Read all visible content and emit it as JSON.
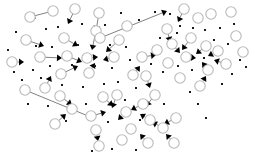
{
  "figure": {
    "kind": "network-graph",
    "title": "",
    "background_color": "#ffffff",
    "width": 255,
    "height": 163
  },
  "chart_data": {
    "type": "scatter",
    "title": "",
    "xlabel": "",
    "ylabel": "",
    "grid": false,
    "legend": false,
    "xlim": [
      0,
      255
    ],
    "ylim": [
      0,
      163
    ],
    "style": {
      "node_fill": "#ffffff",
      "node_stroke": "#b9b9b9",
      "node_radius": 5.2,
      "leaf_color": "#1a1a1a",
      "leaf_size": 2.0,
      "edge_color": "#4a4a4a",
      "edge_width": 0.7,
      "arrow_color": "#000000"
    },
    "counts": {
      "circle_nodes": 58,
      "leaf_dots": 62,
      "edges": 34
    },
    "circle_nodes": [
      [
        30,
        17
      ],
      [
        53,
        11
      ],
      [
        75,
        9
      ],
      [
        99,
        13
      ],
      [
        96,
        31
      ],
      [
        26,
        40
      ],
      [
        64,
        38
      ],
      [
        100,
        38
      ],
      [
        40,
        57
      ],
      [
        67,
        56
      ],
      [
        87,
        58
      ],
      [
        114,
        57
      ],
      [
        61,
        74
      ],
      [
        89,
        73
      ],
      [
        119,
        40
      ],
      [
        127,
        26
      ],
      [
        45,
        88
      ],
      [
        25,
        90
      ],
      [
        60,
        96
      ],
      [
        72,
        109
      ],
      [
        91,
        116
      ],
      [
        96,
        130
      ],
      [
        99,
        146
      ],
      [
        103,
        97
      ],
      [
        117,
        95
      ],
      [
        126,
        112
      ],
      [
        131,
        129
      ],
      [
        122,
        140
      ],
      [
        143,
        104
      ],
      [
        155,
        95
      ],
      [
        150,
        120
      ],
      [
        163,
        128
      ],
      [
        176,
        118
      ],
      [
        184,
        9
      ],
      [
        198,
        18
      ],
      [
        167,
        29
      ],
      [
        191,
        38
      ],
      [
        142,
        57
      ],
      [
        157,
        50
      ],
      [
        172,
        44
      ],
      [
        168,
        63
      ],
      [
        186,
        57
      ],
      [
        206,
        46
      ],
      [
        218,
        51
      ],
      [
        226,
        64
      ],
      [
        208,
        70
      ],
      [
        200,
        86
      ],
      [
        236,
        36
      ],
      [
        243,
        52
      ],
      [
        211,
        14
      ],
      [
        231,
        12
      ],
      [
        146,
        76
      ],
      [
        180,
        78
      ],
      [
        133,
        75
      ],
      [
        148,
        143
      ],
      [
        174,
        143
      ],
      [
        55,
        124
      ],
      [
        12,
        62
      ]
    ],
    "leaf_dots": [
      [
        16,
        32
      ],
      [
        46,
        29
      ],
      [
        58,
        27
      ],
      [
        82,
        24
      ],
      [
        105,
        25
      ],
      [
        121,
        13
      ],
      [
        139,
        20
      ],
      [
        8,
        50
      ],
      [
        36,
        46
      ],
      [
        52,
        47
      ],
      [
        78,
        45
      ],
      [
        93,
        46
      ],
      [
        110,
        45
      ],
      [
        126,
        47
      ],
      [
        14,
        72
      ],
      [
        33,
        70
      ],
      [
        50,
        66
      ],
      [
        72,
        65
      ],
      [
        95,
        66
      ],
      [
        112,
        68
      ],
      [
        130,
        60
      ],
      [
        22,
        80
      ],
      [
        41,
        78
      ],
      [
        62,
        85
      ],
      [
        83,
        87
      ],
      [
        104,
        84
      ],
      [
        118,
        82
      ],
      [
        136,
        88
      ],
      [
        28,
        104
      ],
      [
        48,
        106
      ],
      [
        66,
        121
      ],
      [
        86,
        104
      ],
      [
        108,
        122
      ],
      [
        125,
        100
      ],
      [
        140,
        120
      ],
      [
        92,
        151
      ],
      [
        112,
        149
      ],
      [
        136,
        150
      ],
      [
        155,
        12
      ],
      [
        170,
        14
      ],
      [
        180,
        26
      ],
      [
        160,
        38
      ],
      [
        177,
        33
      ],
      [
        193,
        28
      ],
      [
        205,
        30
      ],
      [
        220,
        28
      ],
      [
        234,
        24
      ],
      [
        151,
        64
      ],
      [
        163,
        72
      ],
      [
        178,
        66
      ],
      [
        192,
        70
      ],
      [
        204,
        58
      ],
      [
        214,
        40
      ],
      [
        228,
        44
      ],
      [
        240,
        60
      ],
      [
        246,
        67
      ],
      [
        232,
        74
      ],
      [
        222,
        84
      ],
      [
        190,
        92
      ],
      [
        198,
        104
      ],
      [
        206,
        118
      ],
      [
        164,
        104
      ]
    ],
    "edges": [
      {
        "from": [
          100,
          38
        ],
        "to": [
          167,
          11
        ]
      },
      {
        "from": [
          25,
          90
        ],
        "to": [
          93,
          118
        ]
      },
      {
        "from": [
          53,
          11
        ],
        "to": [
          30,
          17
        ]
      },
      {
        "from": [
          75,
          9
        ],
        "to": [
          68,
          24
        ]
      },
      {
        "from": [
          99,
          13
        ],
        "to": [
          96,
          31
        ]
      },
      {
        "from": [
          64,
          38
        ],
        "to": [
          78,
          46
        ]
      },
      {
        "from": [
          26,
          40
        ],
        "to": [
          44,
          46
        ]
      },
      {
        "from": [
          40,
          57
        ],
        "to": [
          62,
          58
        ]
      },
      {
        "from": [
          67,
          56
        ],
        "to": [
          82,
          62
        ]
      },
      {
        "from": [
          87,
          58
        ],
        "to": [
          98,
          57
        ]
      },
      {
        "from": [
          114,
          57
        ],
        "to": [
          103,
          60
        ]
      },
      {
        "from": [
          96,
          31
        ],
        "to": [
          92,
          50
        ]
      },
      {
        "from": [
          119,
          40
        ],
        "to": [
          106,
          52
        ]
      },
      {
        "from": [
          61,
          74
        ],
        "to": [
          78,
          66
        ]
      },
      {
        "from": [
          89,
          73
        ],
        "to": [
          95,
          63
        ]
      },
      {
        "from": [
          45,
          88
        ],
        "to": [
          51,
          76
        ]
      },
      {
        "from": [
          60,
          96
        ],
        "to": [
          72,
          105
        ]
      },
      {
        "from": [
          91,
          116
        ],
        "to": [
          106,
          112
        ]
      },
      {
        "from": [
          103,
          97
        ],
        "to": [
          113,
          106
        ]
      },
      {
        "from": [
          117,
          95
        ],
        "to": [
          112,
          108
        ]
      },
      {
        "from": [
          96,
          130
        ],
        "to": [
          98,
          141
        ]
      },
      {
        "from": [
          126,
          112
        ],
        "to": [
          118,
          120
        ]
      },
      {
        "from": [
          143,
          104
        ],
        "to": [
          131,
          110
        ]
      },
      {
        "from": [
          155,
          95
        ],
        "to": [
          146,
          106
        ]
      },
      {
        "from": [
          150,
          120
        ],
        "to": [
          140,
          114
        ]
      },
      {
        "from": [
          163,
          128
        ],
        "to": [
          152,
          122
        ]
      },
      {
        "from": [
          176,
          118
        ],
        "to": [
          164,
          124
        ]
      },
      {
        "from": [
          142,
          57
        ],
        "to": [
          156,
          55
        ]
      },
      {
        "from": [
          167,
          29
        ],
        "to": [
          170,
          42
        ]
      },
      {
        "from": [
          191,
          38
        ],
        "to": [
          182,
          50
        ]
      },
      {
        "from": [
          206,
          46
        ],
        "to": [
          196,
          54
        ]
      },
      {
        "from": [
          218,
          51
        ],
        "to": [
          208,
          56
        ]
      },
      {
        "from": [
          226,
          64
        ],
        "to": [
          214,
          60
        ]
      },
      {
        "from": [
          208,
          70
        ],
        "to": [
          202,
          62
        ]
      },
      {
        "from": [
          186,
          57
        ],
        "to": [
          196,
          58
        ]
      },
      {
        "from": [
          172,
          44
        ],
        "to": [
          180,
          53
        ]
      },
      {
        "from": [
          200,
          86
        ],
        "to": [
          206,
          76
        ]
      },
      {
        "from": [
          146,
          76
        ],
        "to": [
          150,
          88
        ]
      },
      {
        "from": [
          133,
          75
        ],
        "to": [
          140,
          66
        ]
      },
      {
        "from": [
          148,
          143
        ],
        "to": [
          140,
          134
        ]
      },
      {
        "from": [
          174,
          143
        ],
        "to": [
          166,
          134
        ]
      },
      {
        "from": [
          55,
          124
        ],
        "to": [
          66,
          114
        ]
      },
      {
        "from": [
          12,
          62
        ],
        "to": [
          24,
          62
        ]
      },
      {
        "from": [
          184,
          9
        ],
        "to": [
          178,
          22
        ]
      }
    ]
  }
}
